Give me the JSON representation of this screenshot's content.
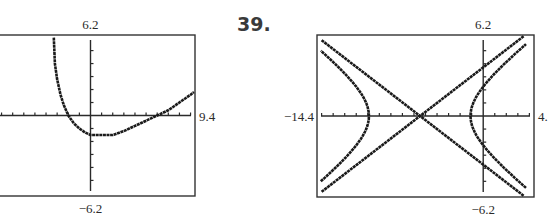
{
  "problem_number": "39.",
  "chart_data": [
    {
      "type": "line",
      "title": "",
      "xlim": [
        -8.5,
        9.4
      ],
      "ylim": [
        -6.2,
        6.2
      ],
      "xlabel": "",
      "ylabel": "",
      "grid": false,
      "tick_step": 1,
      "labels": {
        "ymax": "6.2",
        "ymin": "−6.2",
        "xmax": "9.4",
        "xmin": ""
      },
      "series": [
        {
          "name": "curve",
          "points": [
            [
              -3.3,
              6.0
            ],
            [
              -3.2,
              4.0
            ],
            [
              -3.0,
              2.8
            ],
            [
              -2.7,
              1.6
            ],
            [
              -2.4,
              0.8
            ],
            [
              -2.0,
              0.0
            ],
            [
              -1.5,
              -0.6
            ],
            [
              -1.0,
              -1.0
            ],
            [
              -0.5,
              -1.3
            ],
            [
              0.0,
              -1.5
            ],
            [
              1.0,
              -1.5
            ],
            [
              2.0,
              -1.5
            ],
            [
              3.0,
              -1.2
            ],
            [
              4.0,
              -0.8
            ],
            [
              5.0,
              -0.4
            ],
            [
              6.0,
              0.0
            ],
            [
              7.0,
              0.4
            ],
            [
              8.0,
              1.0
            ],
            [
              9.0,
              1.6
            ],
            [
              9.3,
              1.8
            ]
          ]
        }
      ]
    },
    {
      "type": "line",
      "title": "",
      "xlim": [
        -14.4,
        4.4
      ],
      "ylim": [
        -6.2,
        6.2
      ],
      "xlabel": "",
      "ylabel": "",
      "grid": false,
      "tick_step": 1,
      "labels": {
        "ymax": "6.2",
        "ymin": "−6.2",
        "xmax": "4.",
        "xmin": "−14.4"
      },
      "hyperbola": {
        "center": [
          -5.5,
          0
        ],
        "a": 4.4,
        "asymptote_slope": 0.68
      },
      "series": [
        {
          "name": "asymptote-1",
          "points": [
            [
              -14.0,
              5.8
            ],
            [
              3.5,
              -6.1
            ]
          ]
        },
        {
          "name": "asymptote-2",
          "points": [
            [
              -14.0,
              -5.8
            ],
            [
              3.5,
              6.1
            ]
          ]
        },
        {
          "name": "hyperbola-left-branch",
          "branch": "left"
        },
        {
          "name": "hyperbola-right-branch",
          "branch": "right"
        }
      ]
    }
  ]
}
